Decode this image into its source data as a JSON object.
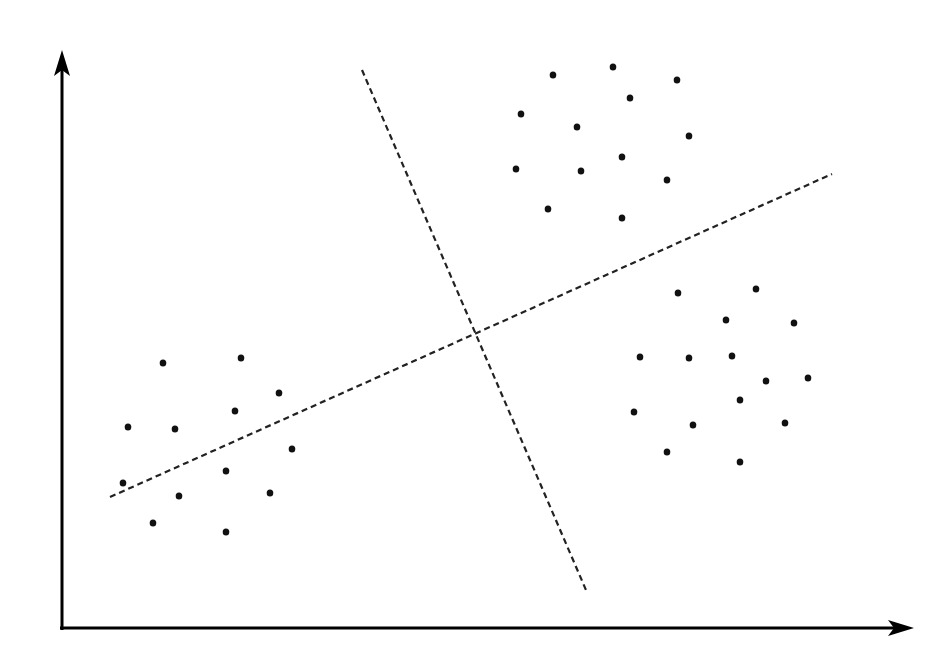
{
  "chart_data": {
    "type": "scatter",
    "title": "",
    "xlabel": "",
    "ylabel": "",
    "grid": false,
    "legend": null,
    "axes": {
      "origin": [
        62,
        628
      ],
      "y_axis_top": [
        62,
        50
      ],
      "x_axis_right": [
        914,
        628
      ],
      "color": "#000000"
    },
    "series": [
      {
        "name": "cluster-left",
        "color": "#111111",
        "points": [
          [
            163,
            363
          ],
          [
            241,
            358
          ],
          [
            279,
            393
          ],
          [
            235,
            411
          ],
          [
            128,
            427
          ],
          [
            175,
            429
          ],
          [
            292,
            449
          ],
          [
            226,
            471
          ],
          [
            123,
            483
          ],
          [
            179,
            496
          ],
          [
            270,
            493
          ],
          [
            153,
            523
          ],
          [
            226,
            532
          ]
        ]
      },
      {
        "name": "cluster-top-right",
        "color": "#111111",
        "points": [
          [
            553,
            75
          ],
          [
            613,
            67
          ],
          [
            677,
            80
          ],
          [
            630,
            98
          ],
          [
            521,
            114
          ],
          [
            577,
            127
          ],
          [
            689,
            136
          ],
          [
            516,
            169
          ],
          [
            581,
            171
          ],
          [
            622,
            157
          ],
          [
            667,
            180
          ],
          [
            548,
            209
          ],
          [
            622,
            218
          ]
        ]
      },
      {
        "name": "cluster-bottom-right",
        "color": "#111111",
        "points": [
          [
            678,
            293
          ],
          [
            756,
            289
          ],
          [
            726,
            320
          ],
          [
            794,
            323
          ],
          [
            640,
            357
          ],
          [
            689,
            358
          ],
          [
            732,
            356
          ],
          [
            766,
            381
          ],
          [
            808,
            378
          ],
          [
            740,
            400
          ],
          [
            634,
            412
          ],
          [
            693,
            425
          ],
          [
            785,
            423
          ],
          [
            667,
            452
          ],
          [
            740,
            462
          ]
        ]
      }
    ],
    "lines": [
      {
        "name": "separator-line-1",
        "style": "dashed",
        "from": [
          110,
          497
        ],
        "to": [
          832,
          174
        ],
        "color": "#222222"
      },
      {
        "name": "separator-line-2",
        "style": "dashed",
        "from": [
          362,
          70
        ],
        "to": [
          586,
          590
        ],
        "color": "#222222"
      }
    ]
  }
}
